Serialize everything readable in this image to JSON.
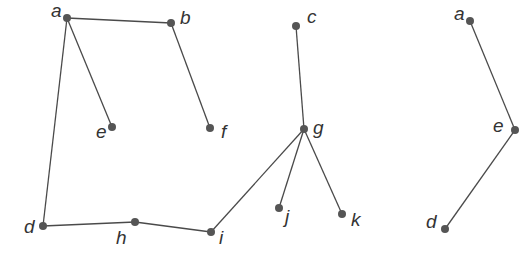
{
  "diagram": {
    "type": "graph",
    "colors": {
      "edge": "#4a4a4a",
      "node": "#555555",
      "label": "#333333",
      "background": "#ffffff"
    },
    "graphs": [
      {
        "id": "left-graph",
        "nodes": [
          {
            "id": "a",
            "label": "a",
            "x": 67,
            "y": 18,
            "lx": 51,
            "ly": 17
          },
          {
            "id": "b",
            "label": "b",
            "x": 171,
            "y": 23,
            "lx": 180,
            "ly": 24
          },
          {
            "id": "e",
            "label": "e",
            "x": 112,
            "y": 127,
            "lx": 96,
            "ly": 138
          },
          {
            "id": "f",
            "label": "f",
            "x": 210,
            "y": 128,
            "lx": 221,
            "ly": 138
          },
          {
            "id": "d",
            "label": "d",
            "x": 43,
            "y": 226,
            "lx": 24,
            "ly": 233
          },
          {
            "id": "h",
            "label": "h",
            "x": 135,
            "y": 222,
            "lx": 116,
            "ly": 244
          },
          {
            "id": "i",
            "label": "i",
            "x": 211,
            "y": 232,
            "lx": 219,
            "ly": 244
          }
        ],
        "edges": [
          [
            "a",
            "b"
          ],
          [
            "a",
            "e"
          ],
          [
            "a",
            "d"
          ],
          [
            "b",
            "f"
          ],
          [
            "d",
            "h"
          ],
          [
            "h",
            "i"
          ]
        ]
      },
      {
        "id": "middle-graph",
        "nodes": [
          {
            "id": "c",
            "label": "c",
            "x": 296,
            "y": 26,
            "lx": 307,
            "ly": 23
          },
          {
            "id": "g",
            "label": "g",
            "x": 304,
            "y": 129,
            "lx": 313,
            "ly": 134
          },
          {
            "id": "j",
            "label": "j",
            "x": 279,
            "y": 208,
            "lx": 285,
            "ly": 223
          },
          {
            "id": "k",
            "label": "k",
            "x": 342,
            "y": 214,
            "lx": 351,
            "ly": 226
          }
        ],
        "edges": [
          [
            "c",
            "g"
          ],
          [
            "g",
            "j"
          ],
          [
            "g",
            "k"
          ]
        ]
      },
      {
        "id": "right-graph",
        "nodes": [
          {
            "id": "a2",
            "label": "a",
            "x": 470,
            "y": 21,
            "lx": 454,
            "ly": 20
          },
          {
            "id": "e2",
            "label": "e",
            "x": 515,
            "y": 130,
            "lx": 493,
            "ly": 132
          },
          {
            "id": "d2",
            "label": "d",
            "x": 445,
            "y": 229,
            "lx": 426,
            "ly": 228
          }
        ],
        "edges": [
          [
            "a2",
            "e2"
          ],
          [
            "e2",
            "d2"
          ]
        ]
      }
    ],
    "cross_edges": [
      [
        "i",
        "g"
      ]
    ]
  }
}
